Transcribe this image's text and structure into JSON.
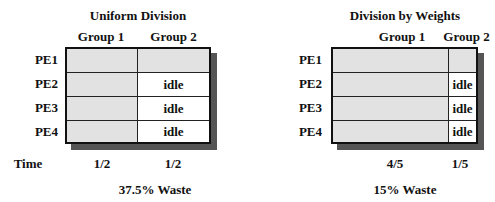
{
  "left": {
    "title": "Uniform Division",
    "headers": [
      "Group 1",
      "Group 2"
    ],
    "rows": [
      {
        "label": "PE1",
        "g1": "",
        "g2": "",
        "g2_idle": false
      },
      {
        "label": "PE2",
        "g1": "",
        "g2": "idle",
        "g2_idle": true
      },
      {
        "label": "PE3",
        "g1": "",
        "g2": "idle",
        "g2_idle": true
      },
      {
        "label": "PE4",
        "g1": "",
        "g2": "idle",
        "g2_idle": true
      }
    ],
    "time_label": "Time",
    "times": [
      "1/2",
      "1/2"
    ],
    "waste": "37.5% Waste"
  },
  "right": {
    "title": "Division by Weights",
    "headers": [
      "Group 1",
      "Group 2"
    ],
    "rows": [
      {
        "label": "PE1",
        "g1": "",
        "g2": "",
        "g2_idle": false
      },
      {
        "label": "PE2",
        "g1": "",
        "g2": "idle",
        "g2_idle": true
      },
      {
        "label": "PE3",
        "g1": "",
        "g2": "idle",
        "g2_idle": true
      },
      {
        "label": "PE4",
        "g1": "",
        "g2": "idle",
        "g2_idle": true
      }
    ],
    "times": [
      "4/5",
      "1/5"
    ],
    "waste": "15% Waste"
  },
  "colors": {
    "busy_fill": "#e2e2e2",
    "idle_fill": "#ffffff",
    "shadow": "#555555",
    "border": "#111111"
  }
}
